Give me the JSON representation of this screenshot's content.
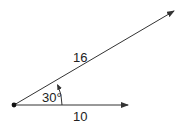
{
  "diagram": {
    "type": "vector-angle",
    "colors": {
      "line": "#333333",
      "text": "#222222",
      "background": "#ffffff"
    },
    "origin": {
      "x": 14,
      "y": 105
    },
    "vectors": [
      {
        "name": "vector-a",
        "magnitude_label": "16",
        "tip": {
          "x": 174,
          "y": 11
        }
      },
      {
        "name": "vector-b",
        "magnitude_label": "10",
        "tip": {
          "x": 128,
          "y": 105
        }
      }
    ],
    "angle": {
      "label": "30°"
    },
    "labels": {
      "a": "16",
      "b": "10",
      "angle": "30°"
    }
  }
}
